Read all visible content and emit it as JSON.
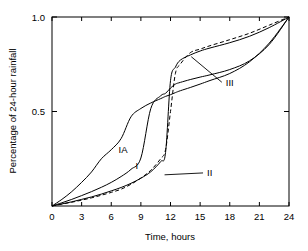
{
  "chart_data": {
    "type": "line",
    "title": "",
    "xlabel": "Time, hours",
    "ylabel": "Percentage of 24-hour rainfall",
    "xlim": [
      0,
      24
    ],
    "ylim": [
      0,
      1.0
    ],
    "xticks": [
      0,
      3,
      6,
      9,
      12,
      15,
      18,
      21,
      24
    ],
    "xticklabels": [
      "0",
      "3",
      "6",
      "9",
      "12",
      "15",
      "18",
      "21",
      "24"
    ],
    "yticks": [
      0.5,
      1.0
    ],
    "yticklabels": [
      "0.5",
      "1.0"
    ],
    "grid": false,
    "legend_position": "inline-annotations",
    "x": [
      0,
      1,
      2,
      3,
      4,
      5,
      6,
      7,
      8,
      9,
      10,
      11,
      11.5,
      12,
      12.5,
      13,
      14,
      15,
      16,
      18,
      20,
      22,
      24
    ],
    "series": [
      {
        "name": "IA",
        "label": "IA",
        "style": "solid",
        "color": "#000000",
        "label_x": 7.2,
        "label_y": 0.3,
        "values": [
          0.0,
          0.035,
          0.076,
          0.125,
          0.18,
          0.25,
          0.298,
          0.357,
          0.472,
          0.516,
          0.545,
          0.568,
          0.58,
          0.589,
          0.6,
          0.61,
          0.627,
          0.645,
          0.664,
          0.701,
          0.763,
          0.862,
          1.0
        ]
      },
      {
        "name": "I",
        "label": "I",
        "style": "solid",
        "color": "#000000",
        "label_x": 8.6,
        "label_y": 0.215,
        "values": [
          0.0,
          0.017,
          0.035,
          0.055,
          0.076,
          0.099,
          0.125,
          0.156,
          0.194,
          0.254,
          0.515,
          0.583,
          0.596,
          0.624,
          0.645,
          0.654,
          0.669,
          0.682,
          0.694,
          0.722,
          0.768,
          0.855,
          1.0
        ]
      },
      {
        "name": "II",
        "label": "II",
        "style": "solid",
        "color": "#000000",
        "label_x": 15.7,
        "label_y": 0.175,
        "leader_from_x": 11.4,
        "leader_from_y": 0.165,
        "values": [
          0.0,
          0.011,
          0.022,
          0.035,
          0.048,
          0.063,
          0.08,
          0.098,
          0.12,
          0.147,
          0.181,
          0.235,
          0.283,
          0.663,
          0.735,
          0.772,
          0.799,
          0.82,
          0.836,
          0.864,
          0.898,
          0.944,
          1.0
        ]
      },
      {
        "name": "III",
        "label": "III",
        "style": "dashed",
        "color": "#000000",
        "label_x": 17.6,
        "label_y": 0.655,
        "leader_from_x": 14.1,
        "leader_from_y": 0.79,
        "values": [
          0.0,
          0.01,
          0.02,
          0.031,
          0.043,
          0.057,
          0.072,
          0.089,
          0.115,
          0.148,
          0.189,
          0.25,
          0.298,
          0.5,
          0.702,
          0.751,
          0.811,
          0.83,
          0.848,
          0.88,
          0.914,
          0.957,
          1.0
        ]
      }
    ]
  },
  "axes": {
    "x_axis_label": "Time, hours",
    "y_axis_label": "Percentage of 24-hour rainfall"
  }
}
